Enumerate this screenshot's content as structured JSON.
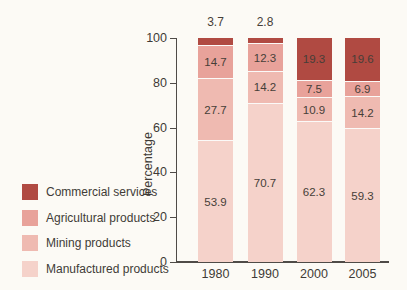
{
  "chart_data": {
    "type": "bar",
    "subtype": "stacked-percentage",
    "title": "",
    "categories": [
      "1980",
      "1990",
      "2000",
      "2005"
    ],
    "series": [
      {
        "name": "Commercial services",
        "color": "#b04a42",
        "values": [
          3.7,
          2.8,
          19.3,
          19.6
        ]
      },
      {
        "name": "Agricultural products",
        "color": "#e8a29a",
        "values": [
          14.7,
          12.3,
          7.5,
          6.9
        ]
      },
      {
        "name": "Mining products",
        "color": "#efbab1",
        "values": [
          27.7,
          14.2,
          10.9,
          14.2
        ]
      },
      {
        "name": "Manufactured products",
        "color": "#f5d2ca",
        "values": [
          53.9,
          70.7,
          62.3,
          59.3
        ]
      }
    ],
    "ylabel": "Percentage",
    "yticks": [
      0,
      20,
      40,
      60,
      80,
      100
    ],
    "ylim": [
      0,
      100
    ],
    "grid": false,
    "legend_position": "left",
    "value_labels": "shown on each segment; values too small to fit (1980: 3.7, 1990: 2.8) are printed above the bars",
    "axis_color": "#4f4b47",
    "background_color": "#fcfaf5"
  }
}
